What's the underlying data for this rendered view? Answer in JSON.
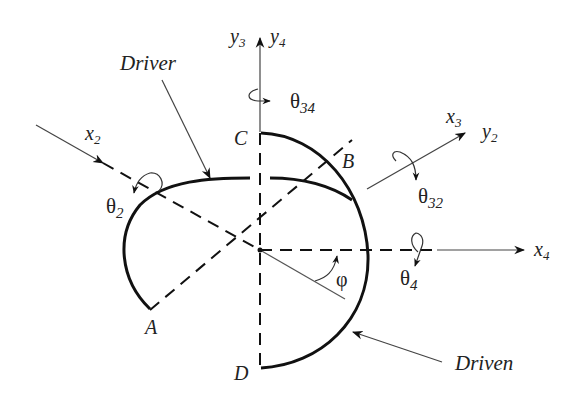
{
  "figure": {
    "colors": {
      "line": "#111111",
      "thin": "#555555",
      "text": "#222222",
      "background": "#ffffff"
    }
  },
  "labels": {
    "driver": "Driver",
    "driven": "Driven",
    "point_A": "A",
    "point_B": "B",
    "point_C": "C",
    "point_D": "D",
    "phi": "φ"
  },
  "axes": {
    "y3": {
      "main": "y",
      "sub": "3"
    },
    "y4": {
      "main": "y",
      "sub": "4"
    },
    "x2": {
      "main": "x",
      "sub": "2"
    },
    "x3": {
      "main": "x",
      "sub": "3"
    },
    "y2": {
      "main": "y",
      "sub": "2"
    },
    "x4": {
      "main": "x",
      "sub": "4"
    }
  },
  "angles": {
    "theta34": {
      "main": "θ",
      "sub": "34"
    },
    "theta2": {
      "main": "θ",
      "sub": "2"
    },
    "theta32": {
      "main": "θ",
      "sub": "32"
    },
    "theta4": {
      "main": "θ",
      "sub": "4"
    }
  }
}
